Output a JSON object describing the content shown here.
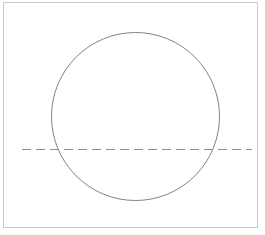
{
  "figure": {
    "canvas": {
      "width": 265,
      "height": 235,
      "background_color": "#ffffff"
    },
    "frame": {
      "name": "outer-border",
      "x": 3.5,
      "y": 2.5,
      "width": 254,
      "height": 225,
      "stroke_color": "#c9c9c9",
      "stroke_width": 1,
      "fill": "none"
    },
    "circle": {
      "name": "circle-outline",
      "center_x": 135.5,
      "center_y": 116.5,
      "radius": 84,
      "stroke_color": "#838383",
      "stroke_width": 1,
      "fill": "none"
    },
    "dashed_line": {
      "name": "horizontal-dashed-line",
      "x1": 22,
      "y1": 149.5,
      "x2": 252,
      "y2": 149.5,
      "stroke_color": "#8e8e8e",
      "stroke_width": 1,
      "dash_length": 9,
      "gap_length": 5,
      "dash_array": "9 5"
    }
  }
}
